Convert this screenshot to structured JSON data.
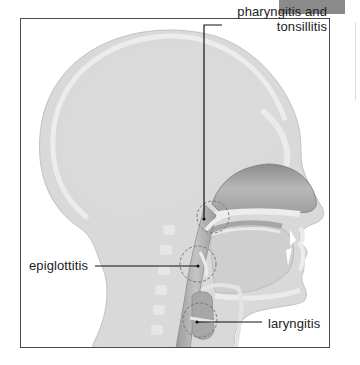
{
  "diagram": {
    "type": "anatomical cross-section",
    "labels": {
      "pharyngitis_line1": "pharyngitis and",
      "pharyngitis_line2": "tonsillitis",
      "epiglottitis": "epiglottitis",
      "laryngitis": "laryngitis"
    },
    "colors": {
      "head_fill": "#d9d9d9",
      "skull_rim": "#e9e9e9",
      "airway": "#a9a9a9",
      "nasal_cavity": "#9c9c9c",
      "frame_border": "#4a4a4a",
      "leader_line": "#111111",
      "highlight_circle": "#777777"
    },
    "highlighted_regions": [
      {
        "name": "pharynx-tonsils",
        "cx": 213,
        "cy": 217,
        "r": 16
      },
      {
        "name": "epiglottis",
        "cx": 198,
        "cy": 264,
        "r": 18
      },
      {
        "name": "larynx",
        "cx": 200,
        "cy": 320,
        "r": 17
      }
    ]
  }
}
